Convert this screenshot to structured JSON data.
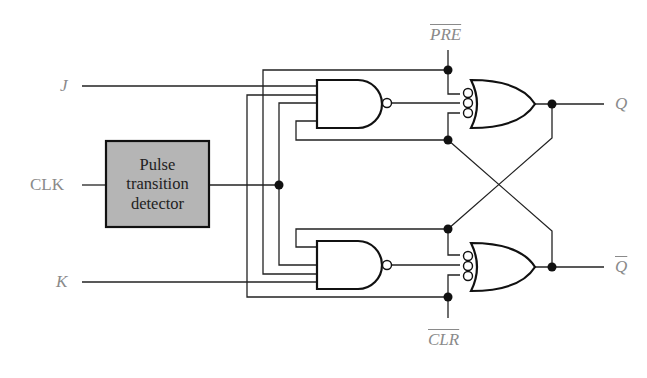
{
  "diagram": {
    "inputs": {
      "j": "J",
      "clk": "CLK",
      "k": "K",
      "pre": "PRE",
      "clr": "CLR"
    },
    "outputs": {
      "q": "Q",
      "q_bar": "Q"
    },
    "block": {
      "lines": [
        "Pulse",
        "transition",
        "detector"
      ],
      "fill": "#b5b5b5"
    },
    "gates": [
      {
        "type": "NAND",
        "position": "upper",
        "inputs": 4
      },
      {
        "type": "NAND",
        "position": "lower",
        "inputs": 4
      },
      {
        "type": "OR (inverted inputs)",
        "position": "upper",
        "inputs": 3,
        "output": "Q"
      },
      {
        "type": "OR (inverted inputs)",
        "position": "lower",
        "inputs": 3,
        "output": "Q-bar"
      }
    ],
    "colors": {
      "wire": "#222222",
      "label": "#8a8a8a",
      "block_fill": "#b5b5b5"
    }
  }
}
